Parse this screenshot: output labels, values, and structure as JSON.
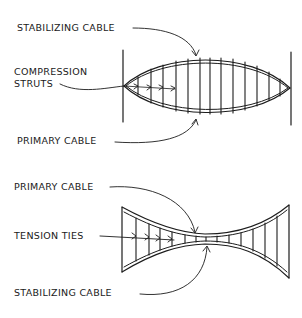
{
  "figure": {
    "top_truss": {
      "type": "convex lens cable truss",
      "labels": {
        "stabilizing_cable": "STABILIZING CABLE",
        "compression_struts_line1": "COMPRESSION",
        "compression_struts_line2": "STRUTS",
        "primary_cable": "PRIMARY CABLE"
      }
    },
    "bottom_truss": {
      "type": "concave cable truss",
      "labels": {
        "primary_cable": "PRIMARY CABLE",
        "tension_ties": "TENSION TIES",
        "stabilizing_cable": "STABILIZING CABLE"
      }
    },
    "colors": {
      "ink": "#1c1c1c",
      "background": "#ffffff"
    }
  }
}
